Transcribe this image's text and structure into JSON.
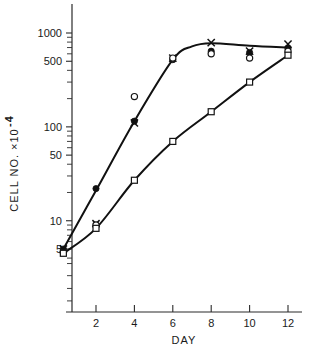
{
  "top_fragment": "...",
  "chart_data": {
    "type": "line",
    "title": "",
    "xlabel": "DAY",
    "ylabel": "CELL  NO.  ×10⁻⁴",
    "ylabel_parts": {
      "text": "CELL  NO.  ×10",
      "exponent": "-4"
    },
    "yscale": "log",
    "ylim": [
      3.3,
      2000
    ],
    "xlim": [
      0,
      13.4
    ],
    "grid": false,
    "legend": "none",
    "xticks": [
      2,
      4,
      6,
      8,
      10,
      12
    ],
    "xtick_labels": [
      "2",
      "4",
      "6",
      "8",
      "10",
      "12"
    ],
    "yticks": [
      5,
      10,
      50,
      100,
      500,
      1000
    ],
    "ytick_labels": [
      "5",
      "10",
      "50",
      "100",
      "500",
      "1000"
    ],
    "yticks_minor": [
      6,
      7,
      8,
      9,
      20,
      30,
      40,
      60,
      70,
      80,
      90,
      200,
      300,
      400,
      600,
      700,
      800,
      900,
      4
    ],
    "series": [
      {
        "name": "filled-circle-series",
        "marker": "filled-circle",
        "has_curve": true,
        "x": [
          0.3,
          2,
          4,
          6,
          8,
          10,
          12
        ],
        "y": [
          5,
          22,
          115,
          520,
          640,
          620,
          690
        ]
      },
      {
        "name": "cross-series",
        "marker": "cross",
        "has_curve": false,
        "x": [
          0.3,
          2,
          4,
          6,
          8,
          10,
          12
        ],
        "y": [
          5,
          9.3,
          110,
          540,
          790,
          640,
          760
        ]
      },
      {
        "name": "open-circle-series",
        "marker": "open-circle",
        "has_curve": false,
        "x": [
          0.3,
          2,
          4,
          6,
          8,
          10,
          12
        ],
        "y": [
          4.6,
          9.0,
          210,
          540,
          600,
          540,
          640
        ]
      },
      {
        "name": "open-square-series",
        "marker": "open-square",
        "has_curve": true,
        "x": [
          0.3,
          2,
          4,
          6,
          8,
          10,
          12
        ],
        "y": [
          4.5,
          8.3,
          27,
          70,
          145,
          300,
          580
        ]
      }
    ],
    "upper_curve_x": [
      0.3,
      2,
      4,
      6,
      7,
      8,
      10,
      12
    ],
    "upper_curve_y": [
      5,
      21,
      115,
      520,
      720,
      780,
      730,
      700
    ],
    "lower_curve_x": [
      0.3,
      2,
      4,
      6,
      8,
      10,
      12
    ],
    "lower_curve_y": [
      4.5,
      8.3,
      27,
      70,
      145,
      300,
      580
    ]
  }
}
